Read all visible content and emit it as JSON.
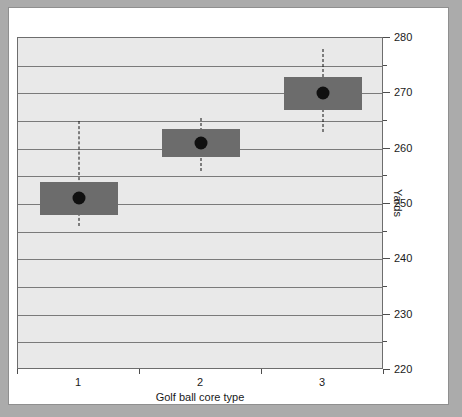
{
  "chart_data": {
    "type": "box",
    "title": "",
    "xlabel": "Golf ball core type",
    "ylabel": "Yards",
    "categories": [
      "1",
      "2",
      "3"
    ],
    "ylim": [
      220,
      280
    ],
    "y_major_ticks": [
      220,
      230,
      240,
      250,
      260,
      270,
      280
    ],
    "y_major_tick_labels": [
      "220",
      "230",
      "240",
      "250",
      "260",
      "270",
      "280"
    ],
    "y_minor_ticks": [
      225,
      235,
      245,
      255,
      265,
      275
    ],
    "y_tick_interval": 5,
    "y_label_interval": 10,
    "y_axis_position": "right",
    "grid": true,
    "grid_axis": "y",
    "legend": "none",
    "series": [
      {
        "name": "Golf ball core type 1",
        "category": "1",
        "center": 251,
        "box_low": 248,
        "box_high": 254,
        "whisker_low": 246,
        "whisker_high": 265
      },
      {
        "name": "Golf ball core type 2",
        "category": "2",
        "center": 261,
        "box_low": 258.5,
        "box_high": 263.5,
        "whisker_low": 256,
        "whisker_high": 265.5
      },
      {
        "name": "Golf ball core type 3",
        "category": "3",
        "center": 270,
        "box_low": 267,
        "box_high": 273,
        "whisker_low": 263,
        "whisker_high": 278
      }
    ],
    "colors": {
      "page_background": "#ababab",
      "card_background": "#ffffff",
      "plot_background": "#e9e9e9",
      "gridline": "#7a7a7a",
      "box_fill": "#6c6c6c",
      "marker": "#101010",
      "whisker": "#111111",
      "axis": "#4d4d4d",
      "text": "#1a1a1a"
    }
  }
}
